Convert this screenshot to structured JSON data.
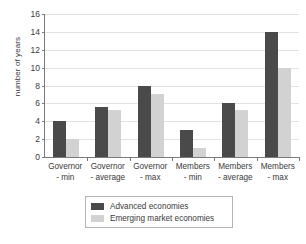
{
  "chart_data": {
    "type": "bar",
    "title": "",
    "xlabel": "",
    "ylabel": "number of years",
    "ylim": [
      0,
      16
    ],
    "ytick_step": 2,
    "yticks": [
      0,
      2,
      4,
      6,
      8,
      10,
      12,
      14,
      16
    ],
    "grid": true,
    "legend_position": "bottom",
    "categories": [
      "Governor - min",
      "Governor - average",
      "Governor - max",
      "Members - min",
      "Members - average",
      "Members - max"
    ],
    "category_lines": [
      {
        "line1": "Governor",
        "line2": "- min"
      },
      {
        "line1": "Governor",
        "line2": "- average"
      },
      {
        "line1": "Governor",
        "line2": "- max"
      },
      {
        "line1": "Members",
        "line2": "- min"
      },
      {
        "line1": "Members",
        "line2": "- average"
      },
      {
        "line1": "Members",
        "line2": "- max"
      }
    ],
    "series": [
      {
        "name": "Advanced economies",
        "color": "#4a4a4a",
        "values": [
          4,
          5.6,
          8,
          3,
          6,
          14
        ]
      },
      {
        "name": "Emerging market economies",
        "color": "#d2d2d2",
        "values": [
          2,
          5.3,
          7,
          1,
          5.3,
          10
        ]
      }
    ]
  },
  "legend": {
    "items": [
      {
        "label": "Advanced economies",
        "color": "#4a4a4a"
      },
      {
        "label": "Emerging market economies",
        "color": "#d2d2d2"
      }
    ]
  },
  "colors": {
    "advanced": "#4a4a4a",
    "emerging": "#d2d2d2",
    "axis": "#7a7a7a",
    "gridline": "#e2e2e2",
    "text": "#3a3a3a",
    "background": "#ffffff"
  }
}
